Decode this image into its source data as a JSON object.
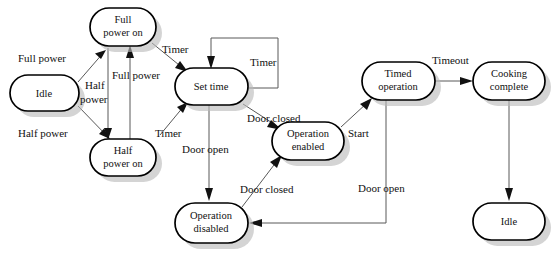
{
  "diagram": {
    "type": "state-transition-diagram",
    "colors": {
      "node_fill": "#ffffff",
      "node_stroke": "#000000",
      "node_shadow": "#b9b9b9",
      "edge": "#585858",
      "text": "#111111",
      "background": "#ffffff"
    },
    "nodes": [
      {
        "id": "full_power_on",
        "label_line1": "Full",
        "label_line2": "power on",
        "x": 90,
        "y": 8,
        "w": 66,
        "h": 38
      },
      {
        "id": "idle_start",
        "label_line1": "Idle",
        "label_line2": "",
        "x": 10,
        "y": 75,
        "w": 69,
        "h": 36
      },
      {
        "id": "half_power_on",
        "label_line1": "Half",
        "label_line2": "power on",
        "x": 90,
        "y": 139,
        "w": 66,
        "h": 37
      },
      {
        "id": "set_time",
        "label_line1": "Set time",
        "label_line2": "",
        "x": 175,
        "y": 68,
        "w": 73,
        "h": 37
      },
      {
        "id": "operation_enabled",
        "label_line1": "Operation",
        "label_line2": "enabled",
        "x": 272,
        "y": 122,
        "w": 72,
        "h": 38
      },
      {
        "id": "operation_disabled",
        "label_line1": "Operation",
        "label_line2": "disabled",
        "x": 175,
        "y": 203,
        "w": 73,
        "h": 40
      },
      {
        "id": "timed_operation",
        "label_line1": "Timed",
        "label_line2": "operation",
        "x": 362,
        "y": 62,
        "w": 73,
        "h": 38
      },
      {
        "id": "cooking_complete",
        "label_line1": "Cooking",
        "label_line2": "complete",
        "x": 473,
        "y": 62,
        "w": 72,
        "h": 38
      },
      {
        "id": "idle_end",
        "label_line1": "Idle",
        "label_line2": "",
        "x": 473,
        "y": 203,
        "w": 72,
        "h": 37
      }
    ],
    "edges": [
      {
        "id": "e_idle_full",
        "label": "Full power",
        "from": "idle_start",
        "to": "full_power_on",
        "label_x": 18,
        "label_y": 62
      },
      {
        "id": "e_idle_half",
        "label": "Half power",
        "from": "idle_start",
        "to": "half_power_on",
        "label_x": 18,
        "label_y": 137
      },
      {
        "id": "e_full_half",
        "label": "Half power",
        "from": "full_power_on",
        "to": "half_power_on",
        "label_x": 85,
        "label_y": 89
      },
      {
        "id": "e_half_full",
        "label": "Full power",
        "from": "half_power_on",
        "to": "full_power_on",
        "label_x": 112,
        "label_y": 79
      },
      {
        "id": "e_full_settime",
        "label": "Timer",
        "from": "full_power_on",
        "to": "set_time",
        "label_x": 162,
        "label_y": 53
      },
      {
        "id": "e_half_settime",
        "label": "Timer",
        "from": "half_power_on",
        "to": "set_time",
        "label_x": 155,
        "label_y": 137
      },
      {
        "id": "e_settime_loop",
        "label": "Timer",
        "from": "set_time",
        "to": "set_time",
        "label_x": 250,
        "label_y": 66
      },
      {
        "id": "e_settime_disabled",
        "label": "Door open",
        "from": "set_time",
        "to": "operation_disabled",
        "label_x": 182,
        "label_y": 153
      },
      {
        "id": "e_settime_enabled",
        "label": "Door closed",
        "from": "set_time",
        "to": "operation_enabled",
        "label_x": 247,
        "label_y": 122
      },
      {
        "id": "e_disabled_enabled",
        "label": "Door closed",
        "from": "operation_disabled",
        "to": "operation_enabled",
        "label_x": 240,
        "label_y": 193
      },
      {
        "id": "e_enabled_timed",
        "label": "Start",
        "from": "operation_enabled",
        "to": "timed_operation",
        "label_x": 348,
        "label_y": 137
      },
      {
        "id": "e_timed_disabled",
        "label": "Door open",
        "from": "timed_operation",
        "to": "operation_disabled",
        "label_x": 358,
        "label_y": 192
      },
      {
        "id": "e_timed_cooking",
        "label": "Timeout",
        "from": "timed_operation",
        "to": "cooking_complete",
        "label_x": 432,
        "label_y": 64
      },
      {
        "id": "e_cooking_idle",
        "label": "",
        "from": "cooking_complete",
        "to": "idle_end",
        "label_x": 0,
        "label_y": 0
      }
    ]
  }
}
